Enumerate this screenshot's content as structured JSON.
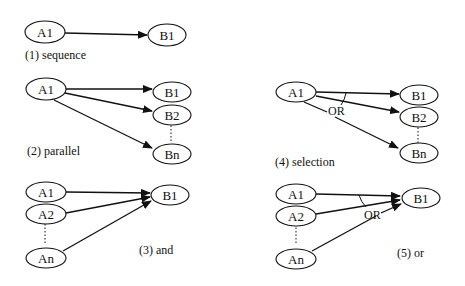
{
  "diagrams": [
    {
      "id": "sequence",
      "caption": "(1) sequence",
      "nodes": [
        {
          "label": "A1"
        },
        {
          "label": "B1"
        }
      ]
    },
    {
      "id": "parallel",
      "caption": "(2) parallel",
      "nodes": [
        {
          "label": "A1"
        },
        {
          "label": "B1"
        },
        {
          "label": "B2"
        },
        {
          "label": "Bn"
        }
      ]
    },
    {
      "id": "and",
      "caption": "(3) and",
      "nodes": [
        {
          "label": "A1"
        },
        {
          "label": "A2"
        },
        {
          "label": "An"
        },
        {
          "label": "B1"
        }
      ]
    },
    {
      "id": "selection",
      "caption": "(4) selection",
      "operator": "OR",
      "nodes": [
        {
          "label": "A1"
        },
        {
          "label": "B1"
        },
        {
          "label": "B2"
        },
        {
          "label": "Bn"
        }
      ]
    },
    {
      "id": "or",
      "caption": "(5) or",
      "operator": "OR",
      "nodes": [
        {
          "label": "A1"
        },
        {
          "label": "A2"
        },
        {
          "label": "An"
        },
        {
          "label": "B1"
        }
      ]
    }
  ]
}
